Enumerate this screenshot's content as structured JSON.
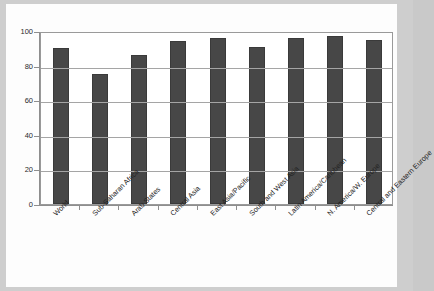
{
  "chart_data": {
    "type": "bar",
    "title": "",
    "subtitle": "",
    "xlabel": "",
    "ylabel": "",
    "ylim": [
      0,
      100
    ],
    "yticks": [
      0,
      20,
      40,
      60,
      80,
      100
    ],
    "ytick_labels": [
      "0",
      "20",
      "40",
      "60",
      "80",
      "100"
    ],
    "grid": true,
    "legend": false,
    "legend_position": "none",
    "bar_color": "#474747",
    "plot_background": "#ffffff",
    "axis_color": "#8e8e8e",
    "categories": [
      "World",
      "Sub-Saharan Africa",
      "Arab States",
      "Central Asia",
      "East Asia/Pacific",
      "South and West Asia",
      "Latin America/Caribbean",
      "N. America/W. Europe",
      "Central and Eastern Europe"
    ],
    "values": [
      90,
      75,
      86,
      94,
      96,
      91,
      96,
      97,
      95
    ],
    "series": [
      {
        "name": "",
        "values": [
          90,
          75,
          86,
          94,
          96,
          91,
          96,
          97,
          95
        ]
      }
    ]
  }
}
